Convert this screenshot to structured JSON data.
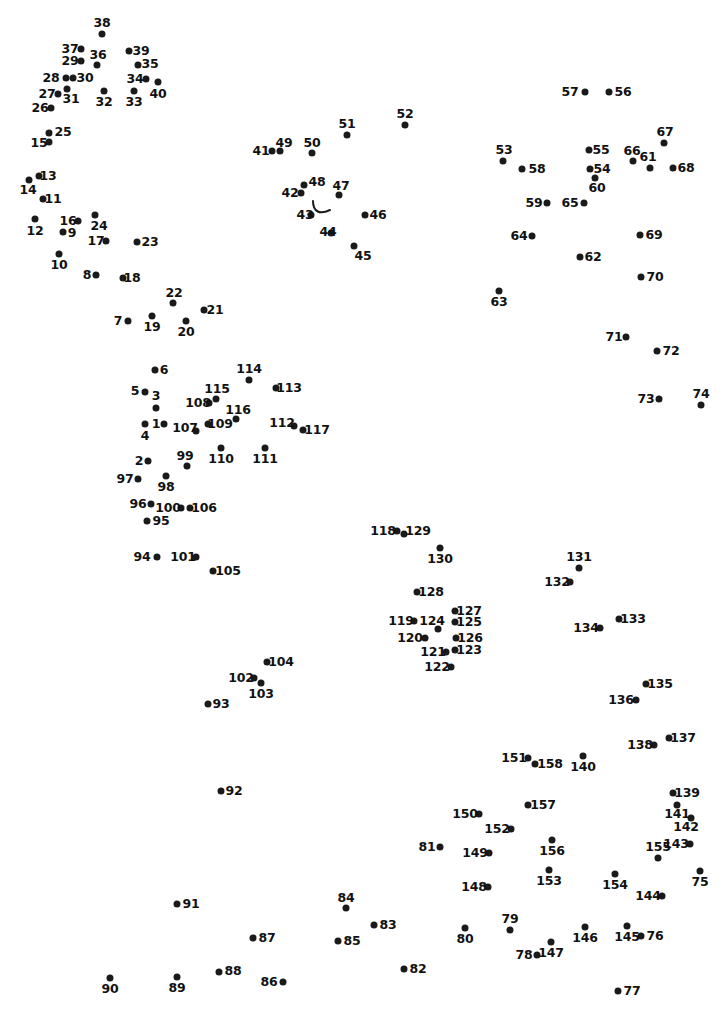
{
  "puzzle": {
    "type": "connect-the-dots",
    "title": "",
    "dot_count": 158,
    "width": 728,
    "height": 1014,
    "dot_color": "#1a1a1a",
    "label_color": "#111111",
    "background_color": "#ffffff",
    "guide_stroke": "#1a1a1a",
    "guide_path": "M 313 201 C 313 212, 320 215, 330 210"
  },
  "dots": [
    {
      "n": "1",
      "x": 164,
      "y": 424,
      "lx": 156,
      "ly": 424
    },
    {
      "n": "2",
      "x": 148,
      "y": 461,
      "lx": 139,
      "ly": 461
    },
    {
      "n": "3",
      "x": 156,
      "y": 408,
      "lx": 156,
      "ly": 396
    },
    {
      "n": "4",
      "x": 145,
      "y": 424,
      "lx": 145,
      "ly": 436
    },
    {
      "n": "5",
      "x": 145,
      "y": 392,
      "lx": 135,
      "ly": 391
    },
    {
      "n": "6",
      "x": 155,
      "y": 370,
      "lx": 164,
      "ly": 370
    },
    {
      "n": "7",
      "x": 128,
      "y": 321,
      "lx": 118,
      "ly": 321
    },
    {
      "n": "8",
      "x": 96,
      "y": 275,
      "lx": 87,
      "ly": 275
    },
    {
      "n": "9",
      "x": 63,
      "y": 232,
      "lx": 72,
      "ly": 233
    },
    {
      "n": "10",
      "x": 59,
      "y": 254,
      "lx": 59,
      "ly": 265
    },
    {
      "n": "11",
      "x": 43,
      "y": 199,
      "lx": 53,
      "ly": 199
    },
    {
      "n": "12",
      "x": 35,
      "y": 219,
      "lx": 35,
      "ly": 231
    },
    {
      "n": "13",
      "x": 39,
      "y": 176,
      "lx": 48,
      "ly": 176
    },
    {
      "n": "14",
      "x": 29,
      "y": 180,
      "lx": 28,
      "ly": 190
    },
    {
      "n": "15",
      "x": 49,
      "y": 142,
      "lx": 39,
      "ly": 143
    },
    {
      "n": "16",
      "x": 78,
      "y": 221,
      "lx": 68,
      "ly": 221
    },
    {
      "n": "17",
      "x": 106,
      "y": 241,
      "lx": 96,
      "ly": 241
    },
    {
      "n": "18",
      "x": 123,
      "y": 278,
      "lx": 132,
      "ly": 278
    },
    {
      "n": "19",
      "x": 152,
      "y": 316,
      "lx": 152,
      "ly": 327
    },
    {
      "n": "20",
      "x": 186,
      "y": 321,
      "lx": 186,
      "ly": 332
    },
    {
      "n": "21",
      "x": 204,
      "y": 310,
      "lx": 215,
      "ly": 310
    },
    {
      "n": "22",
      "x": 173,
      "y": 303,
      "lx": 174,
      "ly": 293
    },
    {
      "n": "23",
      "x": 137,
      "y": 242,
      "lx": 150,
      "ly": 242
    },
    {
      "n": "24",
      "x": 95,
      "y": 215,
      "lx": 99,
      "ly": 226
    },
    {
      "n": "25",
      "x": 49,
      "y": 133,
      "lx": 63,
      "ly": 132
    },
    {
      "n": "26",
      "x": 51,
      "y": 108,
      "lx": 40,
      "ly": 108
    },
    {
      "n": "27",
      "x": 58,
      "y": 94,
      "lx": 47,
      "ly": 94
    },
    {
      "n": "28",
      "x": 66,
      "y": 78,
      "lx": 51,
      "ly": 78
    },
    {
      "n": "29",
      "x": 81,
      "y": 61,
      "lx": 70,
      "ly": 61
    },
    {
      "n": "30",
      "x": 73,
      "y": 78,
      "lx": 85,
      "ly": 78
    },
    {
      "n": "31",
      "x": 67,
      "y": 89,
      "lx": 71,
      "ly": 99
    },
    {
      "n": "32",
      "x": 104,
      "y": 91,
      "lx": 104,
      "ly": 102
    },
    {
      "n": "33",
      "x": 134,
      "y": 91,
      "lx": 134,
      "ly": 102
    },
    {
      "n": "34",
      "x": 146,
      "y": 79,
      "lx": 135,
      "ly": 79
    },
    {
      "n": "35",
      "x": 138,
      "y": 65,
      "lx": 150,
      "ly": 64
    },
    {
      "n": "36",
      "x": 97,
      "y": 65,
      "lx": 98,
      "ly": 55
    },
    {
      "n": "37",
      "x": 81,
      "y": 49,
      "lx": 70,
      "ly": 49
    },
    {
      "n": "38",
      "x": 102,
      "y": 34,
      "lx": 102,
      "ly": 23
    },
    {
      "n": "39",
      "x": 129,
      "y": 51,
      "lx": 141,
      "ly": 51
    },
    {
      "n": "40",
      "x": 158,
      "y": 82,
      "lx": 158,
      "ly": 94
    },
    {
      "n": "41",
      "x": 272,
      "y": 151,
      "lx": 261,
      "ly": 151
    },
    {
      "n": "42",
      "x": 301,
      "y": 193,
      "lx": 290,
      "ly": 193
    },
    {
      "n": "43",
      "x": 311,
      "y": 215,
      "lx": 305,
      "ly": 215
    },
    {
      "n": "44",
      "x": 331,
      "y": 233,
      "lx": 328,
      "ly": 232
    },
    {
      "n": "45",
      "x": 354,
      "y": 246,
      "lx": 363,
      "ly": 256
    },
    {
      "n": "46",
      "x": 365,
      "y": 215,
      "lx": 378,
      "ly": 215
    },
    {
      "n": "47",
      "x": 339,
      "y": 195,
      "lx": 341,
      "ly": 186
    },
    {
      "n": "48",
      "x": 304,
      "y": 185,
      "lx": 317,
      "ly": 182
    },
    {
      "n": "49",
      "x": 280,
      "y": 151,
      "lx": 284,
      "ly": 143
    },
    {
      "n": "50",
      "x": 312,
      "y": 153,
      "lx": 312,
      "ly": 143
    },
    {
      "n": "51",
      "x": 347,
      "y": 135,
      "lx": 347,
      "ly": 124
    },
    {
      "n": "52",
      "x": 405,
      "y": 125,
      "lx": 405,
      "ly": 114
    },
    {
      "n": "53",
      "x": 503,
      "y": 161,
      "lx": 504,
      "ly": 150
    },
    {
      "n": "54",
      "x": 590,
      "y": 169,
      "lx": 602,
      "ly": 169
    },
    {
      "n": "55",
      "x": 589,
      "y": 150,
      "lx": 601,
      "ly": 150
    },
    {
      "n": "56",
      "x": 609,
      "y": 92,
      "lx": 623,
      "ly": 92
    },
    {
      "n": "57",
      "x": 585,
      "y": 92,
      "lx": 570,
      "ly": 92
    },
    {
      "n": "58",
      "x": 522,
      "y": 169,
      "lx": 537,
      "ly": 169
    },
    {
      "n": "59",
      "x": 547,
      "y": 203,
      "lx": 534,
      "ly": 203
    },
    {
      "n": "60",
      "x": 595,
      "y": 178,
      "lx": 597,
      "ly": 188
    },
    {
      "n": "61",
      "x": 650,
      "y": 168,
      "lx": 648,
      "ly": 157
    },
    {
      "n": "62",
      "x": 580,
      "y": 257,
      "lx": 593,
      "ly": 257
    },
    {
      "n": "63",
      "x": 499,
      "y": 291,
      "lx": 499,
      "ly": 302
    },
    {
      "n": "64",
      "x": 532,
      "y": 236,
      "lx": 519,
      "ly": 236
    },
    {
      "n": "65",
      "x": 584,
      "y": 203,
      "lx": 570,
      "ly": 203
    },
    {
      "n": "66",
      "x": 633,
      "y": 161,
      "lx": 632,
      "ly": 151
    },
    {
      "n": "67",
      "x": 664,
      "y": 143,
      "lx": 665,
      "ly": 132
    },
    {
      "n": "68",
      "x": 673,
      "y": 168,
      "lx": 686,
      "ly": 168
    },
    {
      "n": "69",
      "x": 640,
      "y": 235,
      "lx": 654,
      "ly": 235
    },
    {
      "n": "70",
      "x": 641,
      "y": 277,
      "lx": 655,
      "ly": 277
    },
    {
      "n": "71",
      "x": 626,
      "y": 337,
      "lx": 614,
      "ly": 337
    },
    {
      "n": "72",
      "x": 657,
      "y": 351,
      "lx": 671,
      "ly": 351
    },
    {
      "n": "73",
      "x": 659,
      "y": 399,
      "lx": 646,
      "ly": 399
    },
    {
      "n": "74",
      "x": 701,
      "y": 405,
      "lx": 701,
      "ly": 394
    },
    {
      "n": "75",
      "x": 700,
      "y": 871,
      "lx": 700,
      "ly": 882
    },
    {
      "n": "76",
      "x": 641,
      "y": 936,
      "lx": 655,
      "ly": 936
    },
    {
      "n": "77",
      "x": 618,
      "y": 991,
      "lx": 632,
      "ly": 991
    },
    {
      "n": "78",
      "x": 537,
      "y": 955,
      "lx": 524,
      "ly": 955
    },
    {
      "n": "79",
      "x": 510,
      "y": 930,
      "lx": 510,
      "ly": 919
    },
    {
      "n": "80",
      "x": 465,
      "y": 928,
      "lx": 465,
      "ly": 939
    },
    {
      "n": "81",
      "x": 440,
      "y": 847,
      "lx": 427,
      "ly": 847
    },
    {
      "n": "82",
      "x": 404,
      "y": 969,
      "lx": 418,
      "ly": 969
    },
    {
      "n": "83",
      "x": 374,
      "y": 925,
      "lx": 388,
      "ly": 925
    },
    {
      "n": "84",
      "x": 346,
      "y": 908,
      "lx": 346,
      "ly": 898
    },
    {
      "n": "85",
      "x": 338,
      "y": 941,
      "lx": 352,
      "ly": 941
    },
    {
      "n": "86",
      "x": 283,
      "y": 982,
      "lx": 269,
      "ly": 982
    },
    {
      "n": "87",
      "x": 253,
      "y": 938,
      "lx": 267,
      "ly": 938
    },
    {
      "n": "88",
      "x": 219,
      "y": 972,
      "lx": 233,
      "ly": 971
    },
    {
      "n": "89",
      "x": 177,
      "y": 977,
      "lx": 177,
      "ly": 988
    },
    {
      "n": "90",
      "x": 110,
      "y": 978,
      "lx": 110,
      "ly": 989
    },
    {
      "n": "91",
      "x": 177,
      "y": 904,
      "lx": 191,
      "ly": 904
    },
    {
      "n": "92",
      "x": 221,
      "y": 791,
      "lx": 234,
      "ly": 791
    },
    {
      "n": "93",
      "x": 208,
      "y": 704,
      "lx": 221,
      "ly": 704
    },
    {
      "n": "94",
      "x": 157,
      "y": 557,
      "lx": 142,
      "ly": 557
    },
    {
      "n": "95",
      "x": 147,
      "y": 521,
      "lx": 161,
      "ly": 521
    },
    {
      "n": "96",
      "x": 151,
      "y": 504,
      "lx": 138,
      "ly": 504
    },
    {
      "n": "97",
      "x": 138,
      "y": 479,
      "lx": 125,
      "ly": 479
    },
    {
      "n": "98",
      "x": 166,
      "y": 476,
      "lx": 166,
      "ly": 487
    },
    {
      "n": "99",
      "x": 187,
      "y": 466,
      "lx": 185,
      "ly": 456
    },
    {
      "n": "100",
      "x": 181,
      "y": 508,
      "lx": 168,
      "ly": 508
    },
    {
      "n": "101",
      "x": 196,
      "y": 557,
      "lx": 183,
      "ly": 557
    },
    {
      "n": "102",
      "x": 254,
      "y": 678,
      "lx": 241,
      "ly": 678
    },
    {
      "n": "103",
      "x": 261,
      "y": 683,
      "lx": 261,
      "ly": 694
    },
    {
      "n": "104",
      "x": 267,
      "y": 662,
      "lx": 281,
      "ly": 662
    },
    {
      "n": "105",
      "x": 213,
      "y": 571,
      "lx": 228,
      "ly": 571
    },
    {
      "n": "106",
      "x": 190,
      "y": 508,
      "lx": 204,
      "ly": 508
    },
    {
      "n": "107",
      "x": 196,
      "y": 431,
      "lx": 185,
      "ly": 428
    },
    {
      "n": "108",
      "x": 209,
      "y": 403,
      "lx": 198,
      "ly": 403
    },
    {
      "n": "109",
      "x": 208,
      "y": 424,
      "lx": 220,
      "ly": 424
    },
    {
      "n": "110",
      "x": 221,
      "y": 448,
      "lx": 221,
      "ly": 459
    },
    {
      "n": "111",
      "x": 265,
      "y": 448,
      "lx": 265,
      "ly": 459
    },
    {
      "n": "112",
      "x": 294,
      "y": 426,
      "lx": 282,
      "ly": 423
    },
    {
      "n": "113",
      "x": 276,
      "y": 388,
      "lx": 289,
      "ly": 388
    },
    {
      "n": "114",
      "x": 249,
      "y": 380,
      "lx": 249,
      "ly": 369
    },
    {
      "n": "115",
      "x": 216,
      "y": 399,
      "lx": 217,
      "ly": 389
    },
    {
      "n": "116",
      "x": 236,
      "y": 419,
      "lx": 238,
      "ly": 410
    },
    {
      "n": "117",
      "x": 303,
      "y": 430,
      "lx": 317,
      "ly": 430
    },
    {
      "n": "118",
      "x": 397,
      "y": 531,
      "lx": 383,
      "ly": 531
    },
    {
      "n": "119",
      "x": 414,
      "y": 621,
      "lx": 401,
      "ly": 621
    },
    {
      "n": "120",
      "x": 425,
      "y": 638,
      "lx": 410,
      "ly": 638
    },
    {
      "n": "121",
      "x": 446,
      "y": 652,
      "lx": 433,
      "ly": 652
    },
    {
      "n": "122",
      "x": 451,
      "y": 667,
      "lx": 437,
      "ly": 667
    },
    {
      "n": "123",
      "x": 455,
      "y": 650,
      "lx": 469,
      "ly": 650
    },
    {
      "n": "124",
      "x": 438,
      "y": 629,
      "lx": 432,
      "ly": 621
    },
    {
      "n": "125",
      "x": 455,
      "y": 622,
      "lx": 469,
      "ly": 622
    },
    {
      "n": "126",
      "x": 456,
      "y": 638,
      "lx": 470,
      "ly": 638
    },
    {
      "n": "127",
      "x": 455,
      "y": 611,
      "lx": 469,
      "ly": 611
    },
    {
      "n": "128",
      "x": 417,
      "y": 592,
      "lx": 431,
      "ly": 592
    },
    {
      "n": "129",
      "x": 404,
      "y": 534,
      "lx": 418,
      "ly": 531
    },
    {
      "n": "130",
      "x": 440,
      "y": 548,
      "lx": 440,
      "ly": 559
    },
    {
      "n": "131",
      "x": 579,
      "y": 568,
      "lx": 579,
      "ly": 557
    },
    {
      "n": "132",
      "x": 570,
      "y": 582,
      "lx": 557,
      "ly": 582
    },
    {
      "n": "133",
      "x": 619,
      "y": 619,
      "lx": 633,
      "ly": 619
    },
    {
      "n": "134",
      "x": 600,
      "y": 628,
      "lx": 586,
      "ly": 628
    },
    {
      "n": "135",
      "x": 646,
      "y": 684,
      "lx": 660,
      "ly": 684
    },
    {
      "n": "136",
      "x": 636,
      "y": 700,
      "lx": 621,
      "ly": 700
    },
    {
      "n": "137",
      "x": 669,
      "y": 738,
      "lx": 683,
      "ly": 738
    },
    {
      "n": "138",
      "x": 654,
      "y": 745,
      "lx": 640,
      "ly": 745
    },
    {
      "n": "139",
      "x": 673,
      "y": 793,
      "lx": 687,
      "ly": 793
    },
    {
      "n": "140",
      "x": 583,
      "y": 756,
      "lx": 583,
      "ly": 767
    },
    {
      "n": "141",
      "x": 677,
      "y": 805,
      "lx": 677,
      "ly": 814
    },
    {
      "n": "142",
      "x": 691,
      "y": 818,
      "lx": 686,
      "ly": 827
    },
    {
      "n": "143",
      "x": 690,
      "y": 844,
      "lx": 676,
      "ly": 844
    },
    {
      "n": "144",
      "x": 662,
      "y": 896,
      "lx": 648,
      "ly": 896
    },
    {
      "n": "145",
      "x": 627,
      "y": 926,
      "lx": 627,
      "ly": 937
    },
    {
      "n": "146",
      "x": 585,
      "y": 927,
      "lx": 585,
      "ly": 938
    },
    {
      "n": "147",
      "x": 551,
      "y": 942,
      "lx": 551,
      "ly": 953
    },
    {
      "n": "148",
      "x": 488,
      "y": 887,
      "lx": 474,
      "ly": 887
    },
    {
      "n": "149",
      "x": 489,
      "y": 853,
      "lx": 475,
      "ly": 853
    },
    {
      "n": "150",
      "x": 479,
      "y": 814,
      "lx": 465,
      "ly": 814
    },
    {
      "n": "151",
      "x": 528,
      "y": 758,
      "lx": 514,
      "ly": 758
    },
    {
      "n": "152",
      "x": 511,
      "y": 829,
      "lx": 497,
      "ly": 829
    },
    {
      "n": "153",
      "x": 549,
      "y": 870,
      "lx": 549,
      "ly": 881
    },
    {
      "n": "154",
      "x": 615,
      "y": 874,
      "lx": 615,
      "ly": 885
    },
    {
      "n": "155",
      "x": 658,
      "y": 858,
      "lx": 658,
      "ly": 847
    },
    {
      "n": "156",
      "x": 552,
      "y": 840,
      "lx": 552,
      "ly": 851
    },
    {
      "n": "157",
      "x": 528,
      "y": 805,
      "lx": 543,
      "ly": 805
    },
    {
      "n": "158",
      "x": 535,
      "y": 764,
      "lx": 550,
      "ly": 764
    }
  ]
}
